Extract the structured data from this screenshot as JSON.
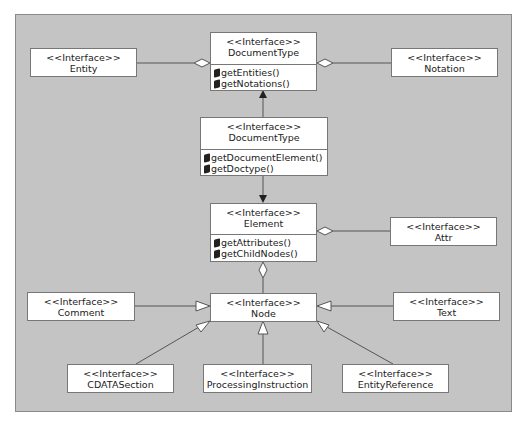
{
  "diagram": {
    "title": "",
    "stereotype_label": "<<Interface>>",
    "colors": {
      "panel_bg": "#c4c4c4",
      "box_bg": "#ffffff",
      "line": "#555555"
    },
    "boxes": {
      "entity": {
        "stereotype": "<<Interface>>",
        "name": "Entity"
      },
      "document_type_top": {
        "stereotype": "<<Interface>>",
        "name": "DocumentType",
        "operations": [
          "getEntities()",
          "getNotations()"
        ]
      },
      "notation": {
        "stereotype": "<<Interface>>",
        "name": "Notation"
      },
      "document_type_mid": {
        "stereotype": "<<Interface>>",
        "name": "DocumentType",
        "operations": [
          "getDocumentElement()",
          "getDoctype()"
        ]
      },
      "element": {
        "stereotype": "<<Interface>>",
        "name": "Element",
        "operations": [
          "getAttributes()",
          "getChildNodes()"
        ]
      },
      "attr": {
        "stereotype": "<<Interface>>",
        "name": "Attr"
      },
      "comment": {
        "stereotype": "<<Interface>>",
        "name": "Comment"
      },
      "node": {
        "stereotype": "<<Interface>>",
        "name": "Node"
      },
      "text": {
        "stereotype": "<<Interface>>",
        "name": "Text"
      },
      "cdata_section": {
        "stereotype": "<<Interface>>",
        "name": "CDATASection"
      },
      "processing_instruction": {
        "stereotype": "<<Interface>>",
        "name": "ProcessingInstruction"
      },
      "entity_reference": {
        "stereotype": "<<Interface>>",
        "name": "EntityReference"
      }
    },
    "relationships": [
      {
        "from": "entity",
        "to": "document_type_top",
        "type": "aggregation"
      },
      {
        "from": "notation",
        "to": "document_type_top",
        "type": "aggregation"
      },
      {
        "from": "document_type_mid",
        "to": "document_type_top",
        "type": "association-arrow"
      },
      {
        "from": "document_type_mid",
        "to": "element",
        "type": "association-arrow"
      },
      {
        "from": "attr",
        "to": "element",
        "type": "aggregation"
      },
      {
        "from": "node",
        "to": "element",
        "type": "aggregation"
      },
      {
        "from": "comment",
        "to": "node",
        "type": "generalization"
      },
      {
        "from": "text",
        "to": "node",
        "type": "generalization"
      },
      {
        "from": "cdata_section",
        "to": "node",
        "type": "generalization"
      },
      {
        "from": "processing_instruction",
        "to": "node",
        "type": "generalization"
      },
      {
        "from": "entity_reference",
        "to": "node",
        "type": "generalization"
      }
    ]
  }
}
